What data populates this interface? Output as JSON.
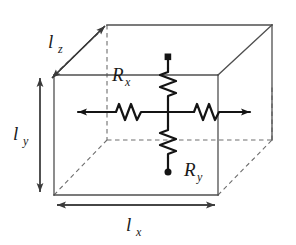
{
  "figure": {
    "kind": "schematic-diagram",
    "colors": {
      "background": "#ffffff",
      "box_edge_visible": "#4f4f4f",
      "box_edge_hidden": "#6e6e6e",
      "circuit_line": "#141414",
      "dimension_arrow": "#3a3a3a",
      "label_text": "#1a1a1a"
    },
    "labels": {
      "lz": {
        "base": "l",
        "sub": "z",
        "full": "l_z"
      },
      "ly": {
        "base": "l",
        "sub": "y",
        "full": "l_y"
      },
      "lx": {
        "base": "l",
        "sub": "x",
        "full": "l_x"
      },
      "Rx": {
        "base": "R",
        "sub": "x",
        "full": "R_x"
      },
      "Ry": {
        "base": "R",
        "sub": "y",
        "full": "R_y"
      }
    },
    "dimension_arrows": [
      {
        "name": "lz",
        "orientation": "diagonal-depth",
        "heads": "both"
      },
      {
        "name": "ly",
        "orientation": "vertical",
        "heads": "both"
      },
      {
        "name": "lx",
        "orientation": "horizontal",
        "heads": "both"
      }
    ],
    "circuit": {
      "horizontal_branch": {
        "label": "Rx",
        "resistor_count": 2,
        "end_arrow_left": true,
        "end_arrow_right": true
      },
      "vertical_branch": {
        "label": "Ry",
        "resistor_count": 2,
        "terminal_dot_top": true,
        "terminal_dot_bottom": true
      }
    }
  }
}
